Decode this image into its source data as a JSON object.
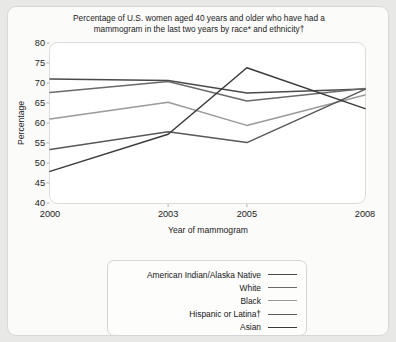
{
  "figure": {
    "background_color": "#fbfbfa",
    "page_background_color": "#e8e8e6",
    "title_line1": "Percentage of U.S. women aged 40 years and older who have had a",
    "title_line2": "mammogram in the last two years by race* and ethnicity†"
  },
  "chart_data": {
    "type": "line",
    "title": "Percentage of U.S. women aged 40 years and older who have had a mammogram in the last two years by race* and ethnicity†",
    "xlabel": "Year of mammogram",
    "ylabel": "Percentage",
    "x": [
      2000,
      2003,
      2005,
      2008
    ],
    "xtick_labels": [
      "2000",
      "2003",
      "2005",
      "2008"
    ],
    "ytick_labels": [
      "40",
      "45",
      "50",
      "55",
      "60",
      "65",
      "70",
      "75",
      "80"
    ],
    "yticks": [
      40,
      45,
      50,
      55,
      60,
      65,
      70,
      75,
      80
    ],
    "ylim": [
      40,
      80
    ],
    "xlim": [
      2000,
      2008
    ],
    "grid": false,
    "legend_position": "below-right",
    "series": [
      {
        "name": "American Indian/Alaska Native",
        "values": [
          71.0,
          70.6,
          67.5,
          68.5
        ],
        "color": "#4a4a4a"
      },
      {
        "name": "White",
        "values": [
          67.6,
          70.4,
          65.5,
          68.6
        ],
        "color": "#6a6a6a"
      },
      {
        "name": "Black",
        "values": [
          61.0,
          65.2,
          59.4,
          67.0
        ],
        "color": "#9a9a9a"
      },
      {
        "name": "Hispanic or Latina†",
        "values": [
          53.4,
          57.8,
          55.1,
          68.4
        ],
        "color": "#585858"
      },
      {
        "name": "Asian",
        "values": [
          47.9,
          57.2,
          73.8,
          63.6
        ],
        "color": "#3a3a3a"
      }
    ]
  }
}
